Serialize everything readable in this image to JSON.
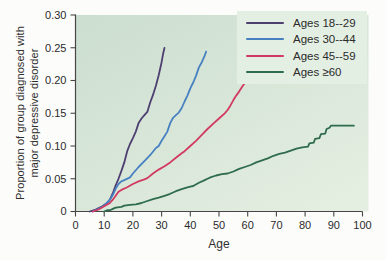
{
  "style": {
    "figure_bg": "#fcfcfa",
    "plot_bg_start": "#cbdecf",
    "plot_bg_end": "#e4eee1",
    "legend_bg": "#e3efe3",
    "axis_color": "#474747",
    "tick_text_color": "#2b2b2b"
  },
  "chart_data": {
    "type": "line",
    "title": "",
    "xlabel": "Age",
    "ylabel": "Proportion of group diagnosed with major depressive disorder",
    "ylabel_lines": [
      "Proportion of group diagnosed with",
      "major depressive disorder"
    ],
    "xlim": [
      0,
      100
    ],
    "ylim": [
      0,
      0.3
    ],
    "x_ticks": [
      0,
      10,
      20,
      30,
      40,
      50,
      60,
      70,
      80,
      90,
      100
    ],
    "x_tick_labels": [
      "0",
      "10",
      "20",
      "30",
      "40",
      "50",
      "60",
      "70",
      "80",
      "90",
      "100"
    ],
    "y_ticks": [
      0,
      0.05,
      0.1,
      0.15,
      0.2,
      0.25,
      0.3
    ],
    "y_tick_labels": [
      "0",
      "0.05",
      "0.10",
      "0.15",
      "0.20",
      "0.25",
      "0.30"
    ],
    "grid": false,
    "legend_position": "top-right",
    "series": [
      {
        "name": "Ages 18--29",
        "color": "#4e3f71",
        "points": [
          [
            5,
            0
          ],
          [
            7,
            0.003
          ],
          [
            9,
            0.007
          ],
          [
            11,
            0.013
          ],
          [
            12,
            0.018
          ],
          [
            13,
            0.028
          ],
          [
            14,
            0.04
          ],
          [
            15,
            0.05
          ],
          [
            16,
            0.062
          ],
          [
            17,
            0.075
          ],
          [
            18,
            0.092
          ],
          [
            19,
            0.103
          ],
          [
            20,
            0.112
          ],
          [
            21,
            0.122
          ],
          [
            22,
            0.135
          ],
          [
            23,
            0.142
          ],
          [
            24,
            0.147
          ],
          [
            25,
            0.152
          ],
          [
            26,
            0.166
          ],
          [
            27,
            0.178
          ],
          [
            28,
            0.192
          ],
          [
            29,
            0.208
          ],
          [
            30,
            0.228
          ],
          [
            30.5,
            0.24
          ],
          [
            31,
            0.25
          ]
        ]
      },
      {
        "name": "Ages 30--44",
        "color": "#4781c1",
        "points": [
          [
            6,
            0
          ],
          [
            8,
            0.004
          ],
          [
            10,
            0.009
          ],
          [
            12,
            0.018
          ],
          [
            13,
            0.025
          ],
          [
            14,
            0.035
          ],
          [
            15,
            0.042
          ],
          [
            16,
            0.046
          ],
          [
            17,
            0.048
          ],
          [
            19,
            0.052
          ],
          [
            20,
            0.058
          ],
          [
            22,
            0.068
          ],
          [
            24,
            0.077
          ],
          [
            26,
            0.086
          ],
          [
            28,
            0.097
          ],
          [
            29,
            0.1
          ],
          [
            30,
            0.108
          ],
          [
            31,
            0.115
          ],
          [
            32,
            0.122
          ],
          [
            33,
            0.135
          ],
          [
            34,
            0.143
          ],
          [
            35,
            0.147
          ],
          [
            36,
            0.151
          ],
          [
            37,
            0.158
          ],
          [
            38,
            0.168
          ],
          [
            39,
            0.177
          ],
          [
            40,
            0.188
          ],
          [
            41,
            0.197
          ],
          [
            42,
            0.207
          ],
          [
            43,
            0.22
          ],
          [
            44,
            0.228
          ],
          [
            45,
            0.238
          ],
          [
            45.5,
            0.244
          ]
        ]
      },
      {
        "name": "Ages 45--59",
        "color": "#d23a61",
        "points": [
          [
            6,
            0
          ],
          [
            8,
            0.003
          ],
          [
            10,
            0.008
          ],
          [
            12,
            0.013
          ],
          [
            13,
            0.018
          ],
          [
            14,
            0.024
          ],
          [
            15,
            0.03
          ],
          [
            16,
            0.033
          ],
          [
            18,
            0.037
          ],
          [
            20,
            0.042
          ],
          [
            22,
            0.046
          ],
          [
            24,
            0.049
          ],
          [
            25,
            0.051
          ],
          [
            27,
            0.058
          ],
          [
            29,
            0.064
          ],
          [
            31,
            0.069
          ],
          [
            33,
            0.075
          ],
          [
            35,
            0.082
          ],
          [
            37,
            0.089
          ],
          [
            38,
            0.092
          ],
          [
            40,
            0.1
          ],
          [
            42,
            0.108
          ],
          [
            44,
            0.117
          ],
          [
            46,
            0.126
          ],
          [
            48,
            0.134
          ],
          [
            50,
            0.142
          ],
          [
            52,
            0.15
          ],
          [
            53,
            0.155
          ],
          [
            54,
            0.162
          ],
          [
            55,
            0.17
          ],
          [
            56,
            0.177
          ],
          [
            57,
            0.183
          ],
          [
            58,
            0.19
          ],
          [
            59,
            0.196
          ],
          [
            60,
            0.198
          ],
          [
            60.5,
            0.202
          ],
          [
            61,
            0.203
          ]
        ]
      },
      {
        "name": "Ages ≥60",
        "color": "#2e6c4c",
        "points": [
          [
            10,
            0
          ],
          [
            11,
            0.002
          ],
          [
            12,
            0.002
          ],
          [
            13,
            0.004
          ],
          [
            14,
            0.006
          ],
          [
            16,
            0.007
          ],
          [
            17,
            0.009
          ],
          [
            19,
            0.01
          ],
          [
            21,
            0.011
          ],
          [
            23,
            0.013
          ],
          [
            25,
            0.016
          ],
          [
            27,
            0.019
          ],
          [
            29,
            0.021
          ],
          [
            31,
            0.024
          ],
          [
            33,
            0.027
          ],
          [
            35,
            0.031
          ],
          [
            37,
            0.034
          ],
          [
            39,
            0.037
          ],
          [
            40,
            0.038
          ],
          [
            41,
            0.039
          ],
          [
            43,
            0.044
          ],
          [
            45,
            0.048
          ],
          [
            46,
            0.05
          ],
          [
            47,
            0.052
          ],
          [
            49,
            0.055
          ],
          [
            51,
            0.057
          ],
          [
            53,
            0.058
          ],
          [
            55,
            0.061
          ],
          [
            57,
            0.065
          ],
          [
            59,
            0.068
          ],
          [
            61,
            0.071
          ],
          [
            63,
            0.075
          ],
          [
            65,
            0.078
          ],
          [
            67,
            0.081
          ],
          [
            69,
            0.085
          ],
          [
            71,
            0.088
          ],
          [
            73,
            0.09
          ],
          [
            75,
            0.093
          ],
          [
            77,
            0.096
          ],
          [
            79,
            0.098
          ],
          [
            81,
            0.099
          ],
          [
            81.5,
            0.104
          ],
          [
            83,
            0.105
          ],
          [
            83.5,
            0.111
          ],
          [
            85,
            0.112
          ],
          [
            85.5,
            0.118
          ],
          [
            87,
            0.119
          ],
          [
            87.5,
            0.126
          ],
          [
            88.5,
            0.128
          ],
          [
            89,
            0.131
          ],
          [
            92,
            0.131
          ],
          [
            97,
            0.131
          ]
        ]
      }
    ]
  }
}
